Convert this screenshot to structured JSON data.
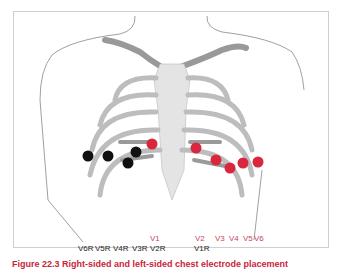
{
  "diagram": {
    "colors": {
      "left_leads": "#d8273f",
      "right_leads": "#111111",
      "bone": "#a8a8a8",
      "outline": "#777777"
    },
    "left_leads": [
      {
        "label": "V1",
        "x": 152,
        "y": 144
      },
      {
        "label": "V2",
        "x": 196,
        "y": 148
      },
      {
        "label": "V3",
        "x": 216,
        "y": 160
      },
      {
        "label": "V4",
        "x": 230,
        "y": 168
      },
      {
        "label": "V5",
        "x": 243,
        "y": 163
      },
      {
        "label": "V6",
        "x": 258,
        "y": 162
      }
    ],
    "right_leads": [
      {
        "label": "V6R",
        "x": 88,
        "y": 156
      },
      {
        "label": "V5R",
        "x": 108,
        "y": 156
      },
      {
        "label": "V4R",
        "x": 136,
        "y": 152
      },
      {
        "label": "V3R",
        "x": 128,
        "y": 163
      }
    ],
    "labels_top": [
      "V1",
      "V2",
      "V3",
      "V4",
      "V5",
      "V6"
    ],
    "labels_bottom": [
      "V6R",
      "V5R",
      "V4R",
      "V3R",
      "V2R",
      "V1R"
    ],
    "caption": "Figure 22.3 Right-sided and left-sided chest electrode placement"
  }
}
